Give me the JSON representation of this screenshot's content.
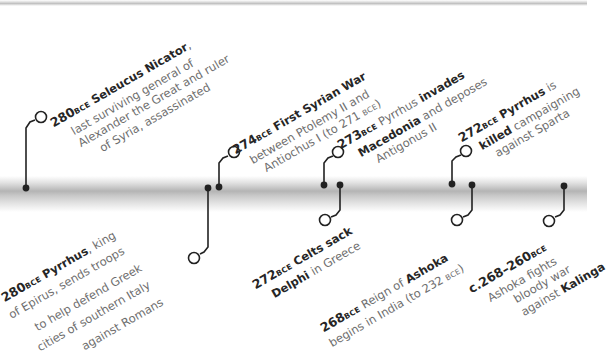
{
  "diagram": {
    "type": "timeline",
    "style": {
      "line_color": "#222222",
      "text_color": "#6e6e6e",
      "highlight_color": "#262626",
      "band_color": "#b4b4b4"
    },
    "events_above": [
      {
        "date": "280",
        "era": "BCE",
        "lines": [
          {
            "pre": "",
            "bold": "Seleucus Nicator",
            "post": ","
          },
          {
            "pre": "last surviving general of",
            "bold": "",
            "post": ""
          },
          {
            "pre": "Alexander the Great and ruler",
            "bold": "",
            "post": ""
          },
          {
            "pre": "of Syria, assassinated",
            "bold": "",
            "post": ""
          }
        ]
      },
      {
        "date": "274",
        "era": "BCE",
        "lines": [
          {
            "pre": "",
            "bold": "First Syrian War",
            "post": ""
          },
          {
            "pre": "between Ptolemy II and",
            "bold": "",
            "post": ""
          },
          {
            "pre": "Antiochus I (to 271 ",
            "bold": "",
            "post": "",
            "era": "BCE",
            "tail": ")"
          }
        ]
      },
      {
        "date": "273",
        "era": "BCE",
        "lines": [
          {
            "pre": "Pyrrhus ",
            "bold": "invades",
            "post": ""
          },
          {
            "pre": "",
            "bold": "Macedonia",
            "post": " and deposes"
          },
          {
            "pre": "Antigonus II",
            "bold": "",
            "post": ""
          }
        ]
      },
      {
        "date": "272",
        "era": "BCE",
        "lines": [
          {
            "pre": "",
            "bold": "Pyrrhus",
            "post": " is"
          },
          {
            "pre": "",
            "bold": "killed",
            "post": " campaigning"
          },
          {
            "pre": "against Sparta",
            "bold": "",
            "post": ""
          }
        ]
      }
    ],
    "events_below": [
      {
        "date": "280",
        "era": "BCE",
        "lines": [
          {
            "pre": "",
            "bold": "Pyrrhus",
            "post": ", king"
          },
          {
            "pre": "of Epirus, sends troops",
            "bold": "",
            "post": ""
          },
          {
            "pre": "to help defend Greek",
            "bold": "",
            "post": ""
          },
          {
            "pre": "cities of southern Italy",
            "bold": "",
            "post": ""
          },
          {
            "pre": "against Romans",
            "bold": "",
            "post": ""
          }
        ]
      },
      {
        "date": "272",
        "era": "BCE",
        "lines": [
          {
            "pre": "",
            "bold": "Celts sack",
            "post": ""
          },
          {
            "pre": "",
            "bold": "Delphi",
            "post": " in Greece"
          }
        ]
      },
      {
        "date": "268",
        "era": "BCE",
        "lines": [
          {
            "pre": "Reign of ",
            "bold": "Ashoka",
            "post": ""
          },
          {
            "pre": "begins in India (to 232 ",
            "bold": "",
            "post": "",
            "era": "BCE",
            "tail": ")"
          }
        ]
      },
      {
        "date": "c.268–260",
        "era": "BCE",
        "lines": [
          {
            "pre": "Ashoka fights",
            "bold": "",
            "post": ""
          },
          {
            "pre": "bloody war",
            "bold": "",
            "post": ""
          },
          {
            "pre": "against ",
            "bold": "Kalinga",
            "post": ""
          }
        ]
      }
    ]
  }
}
